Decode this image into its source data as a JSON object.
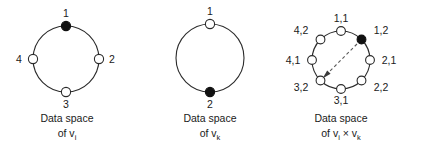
{
  "figure": {
    "background_color": "#ffffff",
    "stroke_color": "#2b2b2b",
    "filled_node_color": "#111111",
    "open_node_color": "#ffffff",
    "arrow_color": "#5a5a5a"
  },
  "panels": [
    {
      "id": "panel-vi",
      "caption_line1": "Data space",
      "caption_line2_prefix": "of v",
      "caption_line2_sub": "i",
      "caption_line2_suffix": "",
      "node_count": 4,
      "nodes": [
        {
          "label": "1",
          "state": "filled",
          "position": "top"
        },
        {
          "label": "2",
          "state": "open",
          "position": "right"
        },
        {
          "label": "3",
          "state": "open",
          "position": "bottom"
        },
        {
          "label": "4",
          "state": "open",
          "position": "left"
        }
      ]
    },
    {
      "id": "panel-vk",
      "caption_line1": "Data space",
      "caption_line2_prefix": "of v",
      "caption_line2_sub": "k",
      "caption_line2_suffix": "",
      "node_count": 2,
      "nodes": [
        {
          "label": "1",
          "state": "open",
          "position": "top"
        },
        {
          "label": "2",
          "state": "filled",
          "position": "bottom"
        }
      ]
    },
    {
      "id": "panel-vi-x-vk",
      "caption_line1": "Data space",
      "caption_line2_prefix": "of v",
      "caption_line2_sub": "i",
      "caption_line2_mid": " × v",
      "caption_line2_sub2": "k",
      "node_count": 8,
      "nodes": [
        {
          "label": "1,1",
          "state": "open",
          "position": "top"
        },
        {
          "label": "1,2",
          "state": "filled",
          "position": "upper-right"
        },
        {
          "label": "2,1",
          "state": "open",
          "position": "right"
        },
        {
          "label": "2,2",
          "state": "open",
          "position": "lower-right"
        },
        {
          "label": "3,1",
          "state": "open",
          "position": "bottom"
        },
        {
          "label": "3,2",
          "state": "open",
          "position": "lower-left"
        },
        {
          "label": "4,1",
          "state": "open",
          "position": "left"
        },
        {
          "label": "4,2",
          "state": "open",
          "position": "upper-left"
        }
      ],
      "arrow": {
        "from": "1,2",
        "to": "3,2",
        "style": "dashed"
      }
    }
  ]
}
